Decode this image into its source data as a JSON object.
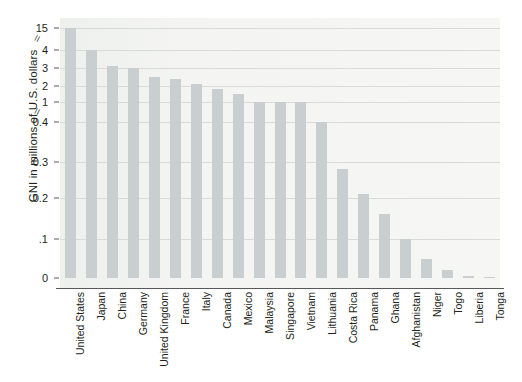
{
  "chart_data": {
    "type": "bar",
    "title": "",
    "xlabel": "",
    "ylabel": "GNI in millions of U.S. dollars",
    "grid": true,
    "legend": false,
    "axis_breaks": [
      "between 15 and 4",
      "between 1 and 0.4"
    ],
    "ytick_labels": [
      "15",
      "4",
      "3",
      "2",
      "1",
      "0.4",
      "0.3",
      "0.2",
      ".1",
      "0"
    ],
    "ytick_values": [
      15,
      4,
      3,
      2,
      1,
      0.4,
      0.3,
      0.2,
      0.1,
      0
    ],
    "categories": [
      "United States",
      "Japan",
      "China",
      "Germany",
      "United Kingdom",
      "France",
      "Italy",
      "Canada",
      "Mexico",
      "Malaysia",
      "Singapore",
      "Vietnam",
      "Lithuania",
      "Costa Rica",
      "Panama",
      "Ghana",
      "Afghanistan",
      "Niger",
      "Togo",
      "Liberia",
      "Tonga"
    ],
    "values": [
      15.0,
      4.0,
      3.1,
      3.0,
      2.5,
      2.4,
      2.1,
      1.8,
      1.5,
      1.0,
      1.0,
      1.0,
      0.4,
      0.28,
      0.21,
      0.16,
      0.1,
      0.05,
      0.02,
      0.005,
      0.002
    ],
    "colors": {
      "bar": "#c9ced1",
      "plot_background": "#f3f4f2",
      "gridline": "#d9dbd8",
      "axis": "#58595b",
      "text": "#231f20"
    }
  }
}
